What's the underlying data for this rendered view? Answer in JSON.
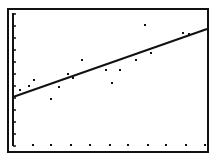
{
  "screen": {
    "background": "#ffffff",
    "ink": "#111111",
    "frame": {
      "x": 8,
      "y": 9,
      "width": 200,
      "height": 143,
      "stroke_width": 2
    }
  },
  "chart_data": {
    "type": "scatter",
    "title": "",
    "xlabel": "",
    "ylabel": "",
    "grid": false,
    "legend": "none",
    "overlay": "linear regression line",
    "plot_area_px": {
      "left": 13,
      "top": 13,
      "right": 206,
      "bottom": 146
    },
    "y_axis": {
      "x": 13,
      "y_top": 13,
      "y_bottom": 146,
      "tick_spacing_px": 12
    },
    "x_axis_ticks_px": [
      33,
      51,
      71,
      90,
      110,
      128,
      148,
      166,
      186,
      205
    ],
    "x_axis_ticks_y_px": 145,
    "points_px": [
      {
        "x": 20,
        "y": 90
      },
      {
        "x": 29,
        "y": 86
      },
      {
        "x": 34,
        "y": 80
      },
      {
        "x": 51,
        "y": 99
      },
      {
        "x": 59,
        "y": 87
      },
      {
        "x": 68,
        "y": 74
      },
      {
        "x": 73,
        "y": 78
      },
      {
        "x": 82,
        "y": 60
      },
      {
        "x": 106,
        "y": 70
      },
      {
        "x": 112,
        "y": 83
      },
      {
        "x": 120,
        "y": 70
      },
      {
        "x": 136,
        "y": 60
      },
      {
        "x": 145,
        "y": 25
      },
      {
        "x": 151,
        "y": 53
      },
      {
        "x": 183,
        "y": 33
      },
      {
        "x": 189,
        "y": 34
      }
    ],
    "regression_line_px": {
      "x1": 13,
      "y1": 97,
      "x2": 207,
      "y2": 29
    }
  }
}
